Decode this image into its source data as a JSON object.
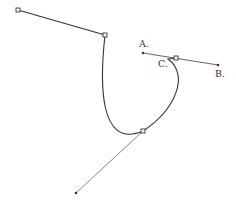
{
  "diagram": {
    "type": "bezier-curve-illustration",
    "labels": {
      "a": "A.",
      "b": "B.",
      "c": "C."
    },
    "colors": {
      "line": "#333333",
      "handle": "#555555",
      "background": "#ffffff"
    },
    "anchors": [
      {
        "name": "anchor-top-left",
        "x": 18,
        "y": 10
      },
      {
        "name": "anchor-top-right",
        "x": 105,
        "y": 35
      },
      {
        "name": "anchor-lower",
        "x": 143,
        "y": 131
      },
      {
        "name": "anchor-c",
        "x": 176,
        "y": 58
      }
    ],
    "handle_points": [
      {
        "name": "point-a",
        "x": 143,
        "y": 53
      },
      {
        "name": "point-b",
        "x": 218,
        "y": 65
      },
      {
        "name": "handle-bottom-left",
        "x": 76,
        "y": 193
      }
    ]
  }
}
